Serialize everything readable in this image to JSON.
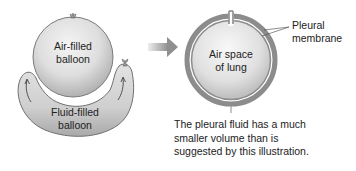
{
  "left_panel": {
    "air_balloon_label_line1": "Air-filled",
    "air_balloon_label_line2": "balloon",
    "fluid_balloon_label_line1": "Fluid-filled",
    "fluid_balloon_label_line2": "balloon"
  },
  "right_panel": {
    "lung_label_line1": "Air space",
    "lung_label_line2": "of lung",
    "membrane_label_line1": "Pleural",
    "membrane_label_line2": "membrane",
    "caption_line1": "The pleural fluid has a much",
    "caption_line2": "smaller volume than is",
    "caption_line3": "suggested by this illustration."
  },
  "colors": {
    "balloon_light": "#ececec",
    "balloon_dark": "#9a9a9a",
    "membrane_gray": "#8c8c8c",
    "arrow_gray": "#999999",
    "text": "#222222"
  }
}
